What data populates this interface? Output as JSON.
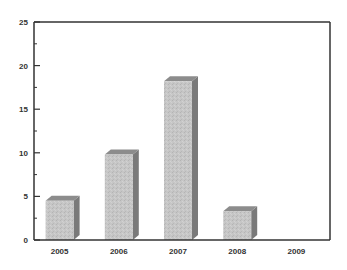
{
  "chart_data": {
    "type": "bar",
    "title": "",
    "xlabel": "",
    "ylabel": "",
    "categories": [
      "2005",
      "2006",
      "2007",
      "2008",
      "2009"
    ],
    "values": [
      4.5,
      9.8,
      18.2,
      3.3,
      0
    ],
    "ylim": [
      0,
      25
    ],
    "yticks": [
      0,
      5,
      10,
      15,
      20,
      25
    ],
    "minor_yticks": [
      2.5,
      7.5,
      12.5,
      17.5,
      22.5
    ],
    "grid": false,
    "legend": null,
    "style": "3d-bar",
    "colors": {
      "bar_front": "#c4c4c4",
      "bar_side": "#7a7a7a",
      "bar_top": "#8c8c8c",
      "axis": "#333333"
    }
  }
}
